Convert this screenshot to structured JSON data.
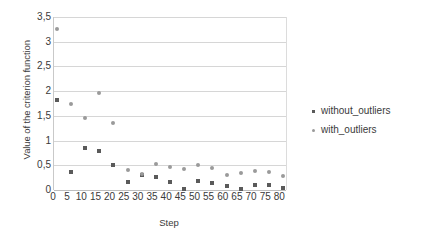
{
  "chart_data": {
    "type": "scatter",
    "title": "",
    "xlabel": "Step",
    "ylabel": "Value of the criterion function",
    "xlim": [
      0,
      82
    ],
    "ylim": [
      0,
      3.5
    ],
    "xticks": [
      "0",
      "5",
      "10",
      "15",
      "20",
      "25",
      "30",
      "35",
      "40",
      "45",
      "50",
      "55",
      "60",
      "65",
      "70",
      "75",
      "80"
    ],
    "xtick_values": [
      0,
      5,
      10,
      15,
      20,
      25,
      30,
      35,
      40,
      45,
      50,
      55,
      60,
      65,
      70,
      75,
      80
    ],
    "yticks": [
      "0",
      "0,5",
      "1",
      "1,5",
      "2",
      "2,5",
      "3",
      "3,5"
    ],
    "ytick_values": [
      0,
      0.5,
      1,
      1.5,
      2,
      2.5,
      3,
      3.5
    ],
    "grid": true,
    "grid_axis": "y",
    "legend_position": "right",
    "decimal_separator": ",",
    "series": [
      {
        "name": "without_outliers",
        "color": "#5a5a5a",
        "marker": "square",
        "points": [
          {
            "x": 1,
            "y": 1.83
          },
          {
            "x": 6,
            "y": 0.36
          },
          {
            "x": 11,
            "y": 0.84
          },
          {
            "x": 16,
            "y": 0.79
          },
          {
            "x": 21,
            "y": 0.5
          },
          {
            "x": 26,
            "y": 0.16
          },
          {
            "x": 31,
            "y": 0.31
          },
          {
            "x": 36,
            "y": 0.26
          },
          {
            "x": 41,
            "y": 0.17
          },
          {
            "x": 46,
            "y": 0.02
          },
          {
            "x": 51,
            "y": 0.19
          },
          {
            "x": 56,
            "y": 0.14
          },
          {
            "x": 61,
            "y": 0.09
          },
          {
            "x": 66,
            "y": 0.02
          },
          {
            "x": 71,
            "y": 0.1
          },
          {
            "x": 76,
            "y": 0.11
          },
          {
            "x": 81,
            "y": 0.05
          }
        ]
      },
      {
        "name": "with_outliers",
        "color": "#9a9a9a",
        "marker": "circle",
        "points": [
          {
            "x": 1,
            "y": 3.25
          },
          {
            "x": 6,
            "y": 1.75
          },
          {
            "x": 11,
            "y": 1.45
          },
          {
            "x": 16,
            "y": 1.97
          },
          {
            "x": 21,
            "y": 1.36
          },
          {
            "x": 26,
            "y": 0.41
          },
          {
            "x": 31,
            "y": 0.33
          },
          {
            "x": 36,
            "y": 0.52
          },
          {
            "x": 41,
            "y": 0.47
          },
          {
            "x": 46,
            "y": 0.42
          },
          {
            "x": 51,
            "y": 0.5
          },
          {
            "x": 56,
            "y": 0.44
          },
          {
            "x": 61,
            "y": 0.31
          },
          {
            "x": 66,
            "y": 0.35
          },
          {
            "x": 71,
            "y": 0.38
          },
          {
            "x": 76,
            "y": 0.37
          },
          {
            "x": 81,
            "y": 0.28
          }
        ]
      }
    ]
  },
  "legend": {
    "items": [
      {
        "label": "without_outliers"
      },
      {
        "label": "with_outliers"
      }
    ]
  }
}
